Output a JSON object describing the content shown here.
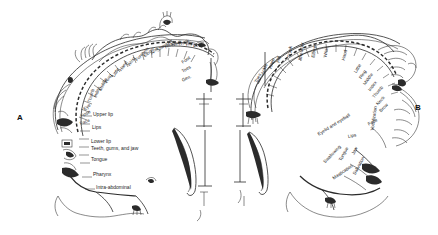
{
  "figure": {
    "background_color": "#ffffff",
    "ink_color": "#2b2b2b"
  },
  "panels": [
    {
      "letter": "A",
      "name": "sensory-homunculus",
      "labels": [
        "Toes",
        "Genitals",
        "Foot",
        "Leg",
        "Hip",
        "Trunk",
        "Neck",
        "Head",
        "Shoulder",
        "Arm",
        "Elbow",
        "Forearm",
        "Wrist",
        "Hand",
        "Little",
        "Ring",
        "Middle",
        "Index",
        "Thumb",
        "Eye",
        "Nose",
        "Face",
        "Upper lip",
        "Lips",
        "Lower lip",
        "Teeth, gums, and jaw",
        "Tongue",
        "Pharynx",
        "Intra-abdominal"
      ],
      "radial_labels": [
        "Middle",
        "Ring",
        "Little",
        "Hand",
        "Wrist",
        "Forearm",
        "Elbow",
        "Arm",
        "Shoulder",
        "Head",
        "Neck",
        "Trunk",
        "Hip",
        "Leg"
      ],
      "arc_labels": [
        "Foot",
        "Toes",
        "Gen."
      ],
      "left_labels": [
        "Index",
        "Thumb",
        "Eye",
        "Nose",
        "Face"
      ],
      "horizontal_labels": [
        "Upper lip",
        "Lips",
        "Lower lip",
        "Teeth, gums, and jaw",
        "Tongue",
        "Pharynx",
        "Intra-abdominal"
      ]
    },
    {
      "letter": "B",
      "name": "motor-homunculus",
      "labels": [
        "Toes",
        "Ankle",
        "Knee",
        "Hip",
        "Trunk",
        "Shoulder",
        "Elbow",
        "Wrist",
        "Hand",
        "Little",
        "Ring",
        "Middle",
        "Index",
        "Thumb",
        "Neck",
        "Brow",
        "Eyelid and eyeball",
        "Face",
        "Lips",
        "Jaw",
        "Tongue",
        "Swallowing",
        "Mastication",
        "Salivation",
        "Vocalization"
      ],
      "top_labels": [
        "Hip",
        "Trunk",
        "Shoulder",
        "Elbow",
        "Wrist"
      ],
      "upper_left_labels": [
        "Toes",
        "Ankle",
        "Knee"
      ],
      "radial_labels": [
        "Hand",
        "Little",
        "Ring",
        "Middle",
        "Index",
        "Thumb",
        "Neck",
        "Brow",
        "Eyelid and eyeball",
        "Face"
      ],
      "lower_labels": [
        "Lips",
        "Jaw",
        "Tongue",
        "Swallowing",
        "Mastication",
        "Salivation",
        "Vocalization"
      ]
    }
  ]
}
